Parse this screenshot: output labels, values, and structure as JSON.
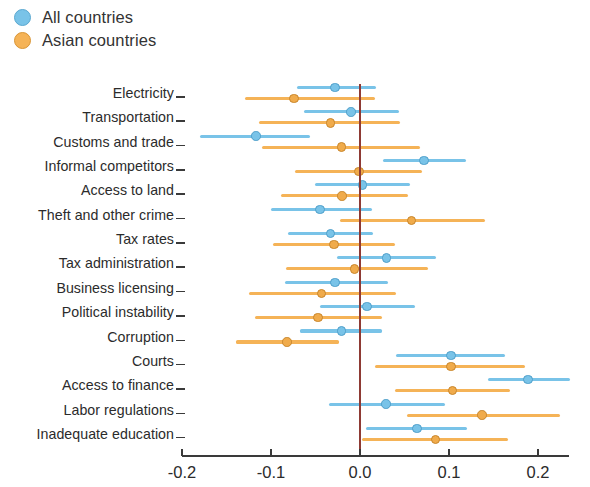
{
  "legend": {
    "position": "top-left",
    "items": [
      {
        "label": "All countries",
        "color": "#79c3e8",
        "icon": "circle-marker-blue"
      },
      {
        "label": "Asian countries",
        "color": "#f5b357",
        "icon": "circle-marker-orange"
      }
    ]
  },
  "axis": {
    "x_ticks": [
      "-0.2",
      "-0.1",
      "0.0",
      "0.1",
      "0.2"
    ],
    "zero_line_color": "#8e3a34"
  },
  "chart_data": {
    "type": "scatter",
    "subtype": "dot-plot-with-confidence-intervals",
    "title": "",
    "subtitle": "",
    "xlabel": "",
    "ylabel": "",
    "xlim": [
      -0.2,
      0.24
    ],
    "xticks": [
      -0.2,
      -0.1,
      0.0,
      0.1,
      0.2
    ],
    "xticklabels": [
      "-0.2",
      "-0.1",
      "0.0",
      "0.1",
      "0.2"
    ],
    "grid": false,
    "legend_position": "top-left",
    "orientation": "horizontal",
    "reference_line": 0.0,
    "categories": [
      "Electricity",
      "Transportation",
      "Customs and trade",
      "Informal competitors",
      "Access to land",
      "Theft and other crime",
      "Tax rates",
      "Tax administration",
      "Business licensing",
      "Political instability",
      "Corruption",
      "Courts",
      "Access to finance",
      "Labor regulations",
      "Inadequate education"
    ],
    "series": [
      {
        "name": "All countries",
        "color": "#79c3e8",
        "values": [
          -0.028,
          -0.01,
          -0.117,
          0.072,
          0.003,
          -0.045,
          -0.033,
          0.03,
          -0.028,
          0.008,
          -0.021,
          0.102,
          0.189,
          0.029,
          0.064
        ],
        "ci_low": [
          -0.071,
          -0.063,
          -0.18,
          0.026,
          -0.051,
          -0.1,
          -0.081,
          -0.026,
          -0.084,
          -0.045,
          -0.067,
          0.041,
          0.144,
          -0.035,
          0.007
        ],
        "ci_high": [
          0.018,
          0.044,
          -0.056,
          0.119,
          0.056,
          0.013,
          0.015,
          0.085,
          0.031,
          0.062,
          0.025,
          0.163,
          0.236,
          0.096,
          0.12
        ]
      },
      {
        "name": "Asian countries",
        "color": "#f5b357",
        "values": [
          -0.074,
          -0.033,
          -0.021,
          -0.001,
          -0.02,
          0.058,
          -0.029,
          -0.006,
          -0.043,
          -0.047,
          -0.082,
          0.102,
          0.104,
          0.137,
          0.085
        ],
        "ci_low": [
          -0.129,
          -0.113,
          -0.11,
          -0.073,
          -0.089,
          -0.022,
          -0.098,
          -0.083,
          -0.125,
          -0.118,
          -0.139,
          0.017,
          0.039,
          0.053,
          0.002
        ],
        "ci_high": [
          0.017,
          0.045,
          0.067,
          0.07,
          0.054,
          0.14,
          0.039,
          0.076,
          0.04,
          0.025,
          -0.024,
          0.185,
          0.169,
          0.225,
          0.166
        ]
      }
    ]
  }
}
